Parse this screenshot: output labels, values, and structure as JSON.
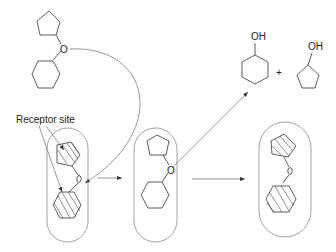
{
  "diagram": {
    "type": "enzyme-substrate binding schematic",
    "labels": {
      "receptor_site": "Receptor site",
      "oxygen": "O",
      "hydroxyl_1": "OH",
      "hydroxyl_2": "OH",
      "plus": "+"
    },
    "nodes": [
      {
        "id": "free-ether",
        "description": "cyclopentyl cyclohexyl ether (free substrate)"
      },
      {
        "id": "enzyme-bound-strained",
        "description": "receptor capsule with hatched rings, strained ether"
      },
      {
        "id": "enzyme-complex",
        "description": "capsule with ether bound"
      },
      {
        "id": "products",
        "description": "cyclohexanol + cyclopentanol"
      },
      {
        "id": "enzyme-regenerated",
        "description": "receptor capsule with hatched rings"
      }
    ],
    "edges": [
      {
        "from": "free-ether",
        "to": "enzyme-bound-strained",
        "style": "curved arrow"
      },
      {
        "from": "enzyme-bound-strained",
        "to": "enzyme-complex",
        "style": "straight arrow"
      },
      {
        "from": "enzyme-complex",
        "to": "products",
        "style": "diagonal arrow"
      },
      {
        "from": "enzyme-complex",
        "to": "enzyme-regenerated",
        "style": "straight arrow"
      }
    ]
  }
}
